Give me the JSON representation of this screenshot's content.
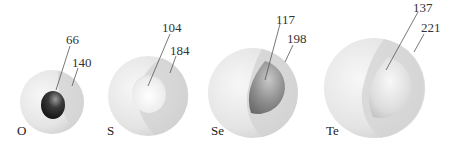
{
  "diagram": {
    "units": "pm",
    "elements": [
      {
        "symbol": "O",
        "atomic_radius": "66",
        "ionic_radius": "140"
      },
      {
        "symbol": "S",
        "atomic_radius": "104",
        "ionic_radius": "184"
      },
      {
        "symbol": "Se",
        "atomic_radius": "117",
        "ionic_radius": "198"
      },
      {
        "symbol": "Te",
        "atomic_radius": "137",
        "ionic_radius": "221"
      }
    ],
    "colors": {
      "outer_sphere": "#e6e6e6",
      "outer_sphere_shadow": "#d2d2d2",
      "O_atom": "#2a2a2a",
      "S_atom": "#f2f2f2",
      "Se_atom": "#8a8a8a",
      "Te_atom": "#dedede",
      "leader_line": "#555555"
    }
  }
}
